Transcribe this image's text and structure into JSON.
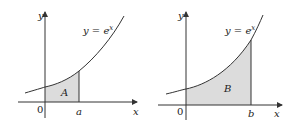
{
  "panels": [
    {
      "id": "left",
      "curve_label": "y = e",
      "curve_exponent": "x",
      "region_label": "A",
      "x_axis_label": "x",
      "y_axis_label": "y",
      "origin_label": "0",
      "bound_label": "a"
    },
    {
      "id": "right",
      "curve_label": "y = e",
      "curve_exponent": "x",
      "region_label": "B",
      "x_axis_label": "x",
      "y_axis_label": "y",
      "origin_label": "0",
      "bound_label": "b"
    }
  ],
  "colors": {
    "shade": "#dcdcdc",
    "line": "#333333"
  }
}
